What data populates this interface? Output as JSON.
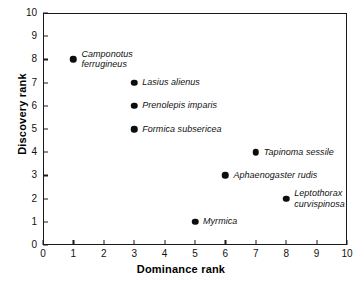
{
  "chart_data": {
    "type": "scatter",
    "title": "",
    "xlabel": "Dominance rank",
    "ylabel": "Discovery rank",
    "xlim": [
      0,
      10
    ],
    "ylim": [
      0,
      10
    ],
    "xticks": [
      "0",
      "1",
      "2",
      "3",
      "4",
      "5",
      "6",
      "7",
      "8",
      "9",
      "10"
    ],
    "yticks": [
      "0",
      "1",
      "2",
      "3",
      "4",
      "5",
      "6",
      "7",
      "8",
      "9",
      "10"
    ],
    "grid": false,
    "legend": "none",
    "marker_color": "#0d0d0d",
    "points": [
      {
        "label": "Camponotus\nferrugineus",
        "x": 1,
        "y": 8,
        "label_side": "right",
        "label_lines": 2
      },
      {
        "label": "Lasius alienus",
        "x": 3,
        "y": 7,
        "label_side": "right",
        "label_lines": 1
      },
      {
        "label": "Prenolepis imparis",
        "x": 3,
        "y": 6,
        "label_side": "right",
        "label_lines": 1
      },
      {
        "label": "Formica subsericea",
        "x": 3,
        "y": 5,
        "label_side": "right",
        "label_lines": 1
      },
      {
        "label": "Tapinoma sessile",
        "x": 7,
        "y": 4,
        "label_side": "right",
        "label_lines": 1
      },
      {
        "label": "Aphaenogaster rudis",
        "x": 6,
        "y": 3,
        "label_side": "right",
        "label_lines": 1
      },
      {
        "label": "Leptothorax\ncurvispinosa",
        "x": 8,
        "y": 2,
        "label_side": "right",
        "label_lines": 2
      },
      {
        "label": "Myrmica",
        "x": 5,
        "y": 1,
        "label_side": "right",
        "label_lines": 1
      }
    ]
  }
}
